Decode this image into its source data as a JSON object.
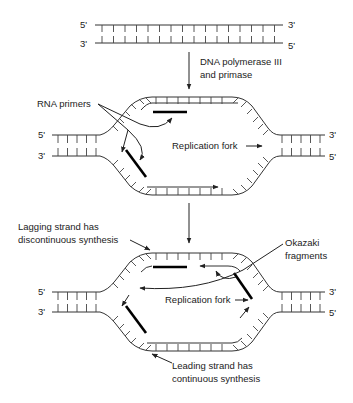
{
  "diagram": {
    "top_duplex": {
      "top_left_end": "5'",
      "top_right_end": "3'",
      "bottom_left_end": "3'",
      "bottom_right_end": "5'"
    },
    "step_arrow_label_line1": "DNA polymerase III",
    "step_arrow_label_line2": "and primase",
    "bubble1": {
      "left_top_end": "5'",
      "left_bottom_end": "3'",
      "right_top_end": "3'",
      "right_bottom_end": "5'",
      "rna_primers_label": "RNA primers",
      "replication_fork_label": "Replication fork"
    },
    "bubble2": {
      "left_top_end": "5'",
      "left_bottom_end": "3'",
      "right_top_end": "3'",
      "right_bottom_end": "5'",
      "lagging_label_line1": "Lagging strand has",
      "lagging_label_line2": "discontinuous synthesis",
      "okazaki_label_line1": "Okazaki",
      "okazaki_label_line2": "fragments",
      "replication_fork_label": "Replication fork",
      "leading_label_line1": "Leading strand has",
      "leading_label_line2": "continuous synthesis"
    },
    "colors": {
      "strand": "#333333",
      "primer": "#000000",
      "text": "#222222",
      "background": "#ffffff"
    }
  }
}
